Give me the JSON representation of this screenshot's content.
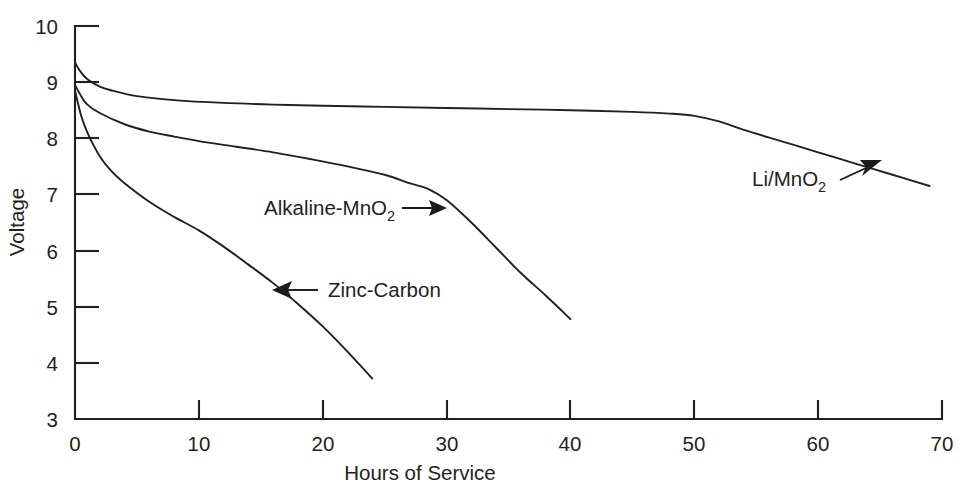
{
  "chart_data": {
    "type": "line",
    "title": "",
    "xlabel": "Hours of Service",
    "ylabel": "Voltage",
    "xlim": [
      0,
      70
    ],
    "ylim": [
      3,
      10
    ],
    "grid": false,
    "legend_position": "inline-annotations",
    "xticks": [
      0,
      10,
      20,
      30,
      40,
      50,
      60,
      70
    ],
    "xtick_labels": [
      "0",
      "10",
      "20",
      "30",
      "40",
      "50",
      "60",
      "70"
    ],
    "yticks": [
      3,
      4,
      5,
      6,
      7,
      8,
      9,
      10
    ],
    "ytick_labels": [
      "3",
      "4",
      "5",
      "6",
      "7",
      "8",
      "9",
      "10"
    ],
    "series": [
      {
        "name": "Li/MnO2",
        "label_text": "Li/MnO",
        "label_sub": "2",
        "color": "#231f20",
        "x": [
          0,
          0.4,
          1,
          2,
          3,
          5,
          8,
          12,
          16,
          20,
          25,
          30,
          35,
          40,
          45,
          48,
          50,
          52,
          54,
          57,
          60,
          63,
          66,
          69
        ],
        "y": [
          9.35,
          9.2,
          9.05,
          8.92,
          8.85,
          8.75,
          8.68,
          8.63,
          8.6,
          8.58,
          8.56,
          8.54,
          8.52,
          8.5,
          8.47,
          8.44,
          8.4,
          8.3,
          8.15,
          7.95,
          7.75,
          7.55,
          7.35,
          7.15
        ]
      },
      {
        "name": "Alkaline-MnO2",
        "label_text": "Alkaline-MnO",
        "label_sub": "2",
        "color": "#231f20",
        "x": [
          0,
          0.5,
          1,
          2,
          4,
          6,
          8,
          10,
          13,
          16,
          19,
          22,
          25,
          27,
          28.5,
          30,
          32,
          34,
          36,
          38,
          40
        ],
        "y": [
          8.95,
          8.75,
          8.6,
          8.45,
          8.25,
          8.12,
          8.03,
          7.95,
          7.85,
          7.75,
          7.63,
          7.5,
          7.35,
          7.2,
          7.1,
          6.9,
          6.5,
          6.05,
          5.6,
          5.2,
          4.78
        ]
      },
      {
        "name": "Zinc-Carbon",
        "label_text": "Zinc-Carbon",
        "label_sub": "",
        "color": "#231f20",
        "x": [
          0,
          0.5,
          1,
          2,
          3,
          4,
          6,
          8,
          10,
          12,
          14,
          16,
          18,
          20,
          22,
          24
        ],
        "y": [
          8.85,
          8.4,
          8.1,
          7.68,
          7.4,
          7.2,
          6.87,
          6.6,
          6.36,
          6.07,
          5.75,
          5.42,
          5.05,
          4.65,
          4.2,
          3.72
        ]
      }
    ],
    "annotations": [
      {
        "name": "li-mno2-annotation",
        "text": "Li/MnO",
        "sub": "2",
        "arrow": "up-right"
      },
      {
        "name": "alkaline-mno2-annotation",
        "text": "Alkaline-MnO",
        "sub": "2",
        "arrow": "right"
      },
      {
        "name": "zinc-carbon-annotation",
        "text": "Zinc-Carbon",
        "sub": "",
        "arrow": "left"
      }
    ]
  },
  "axes": {
    "y_title": "Voltage",
    "x_title": "Hours of Service",
    "y_labels": [
      "10",
      "9",
      "8",
      "7",
      "6",
      "5",
      "4",
      "3"
    ],
    "x_labels": [
      "0",
      "10",
      "20",
      "30",
      "40",
      "50",
      "60",
      "70"
    ]
  },
  "colors": {
    "ink": "#231f20",
    "background": "#ffffff"
  }
}
